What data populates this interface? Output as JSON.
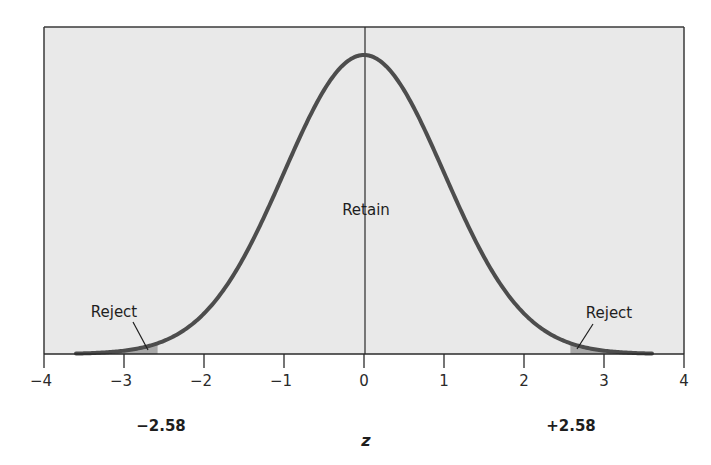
{
  "chart_data": {
    "type": "line",
    "title": "",
    "subtitle": "",
    "xlabel": "z",
    "ylabel": "",
    "xlim": [
      -4,
      4
    ],
    "x_ticks": [
      -4,
      -3,
      -2,
      -1,
      0,
      1,
      2,
      3,
      4
    ],
    "x_tick_labels": [
      "−4",
      "−3",
      "−2",
      "−1",
      "0",
      "1",
      "2",
      "3",
      "4"
    ],
    "grid": false,
    "legend": null,
    "curve_range": [
      -3.6,
      3.6
    ],
    "series": [
      {
        "name": "Standard normal density",
        "x": [
          -3.5,
          -3,
          -2.58,
          -2,
          -1.5,
          -1,
          -0.5,
          0,
          0.5,
          1,
          1.5,
          2,
          2.58,
          3,
          3.5
        ],
        "y": [
          0.0009,
          0.0044,
          0.0143,
          0.054,
          0.1295,
          0.242,
          0.3521,
          0.3989,
          0.3521,
          0.242,
          0.1295,
          0.054,
          0.0143,
          0.0044,
          0.0009
        ]
      }
    ],
    "critical_values": [
      -2.58,
      2.58
    ],
    "critical_value_labels": [
      "−2.58",
      "+2.58"
    ],
    "regions": [
      {
        "label": "Reject",
        "from": -3.6,
        "to": -2.58,
        "shaded": true
      },
      {
        "label": "Retain",
        "from": -2.58,
        "to": 2.58,
        "shaded": false
      },
      {
        "label": "Reject",
        "from": 2.58,
        "to": 3.6,
        "shaded": true
      }
    ],
    "annotations": [
      {
        "text": "Retain",
        "x": 0,
        "position": "center"
      },
      {
        "text": "Reject",
        "x": -2.7,
        "position": "left tail",
        "arrow": true
      },
      {
        "text": "Reject",
        "x": 2.7,
        "position": "right tail",
        "arrow": true
      }
    ],
    "colors": {
      "plot_background": "#e9e9e9",
      "curve": "#4d4d4d",
      "rejection_shade": "#a9a9a9",
      "frame": "#3a3a3a"
    }
  },
  "labels": {
    "retain": "Retain",
    "reject_left": "Reject",
    "reject_right": "Reject",
    "crit_left": "−2.58",
    "crit_right": "+2.58",
    "axis_title": "z"
  }
}
